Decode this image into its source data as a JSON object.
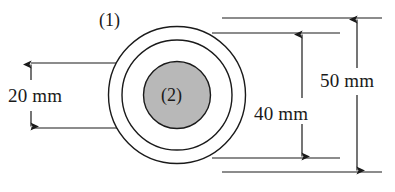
{
  "figure": {
    "type": "engineering-cross-section-diagram",
    "background_color": "#ffffff",
    "line_color": "#1a1a1a",
    "geometry": {
      "center": {
        "x": 177,
        "y": 95
      },
      "circles": [
        {
          "name": "outer-circle",
          "radius": 68.5,
          "diameter_mm": 50,
          "fill": "#ffffff",
          "stroke": "#1a1a1a"
        },
        {
          "name": "middle-circle",
          "radius": 55,
          "diameter_mm": 40,
          "fill": "#ffffff",
          "stroke": "#1a1a1a"
        },
        {
          "name": "inner-circle",
          "radius": 33.5,
          "diameter_mm": 20,
          "fill": "#b8b8b8",
          "stroke": "#1a1a1a"
        }
      ]
    },
    "part_labels": [
      {
        "id": "part-1",
        "text": "(1)",
        "refers_to": "outer-annulus"
      },
      {
        "id": "part-2",
        "text": "(2)",
        "refers_to": "inner-core"
      }
    ],
    "dimensions": [
      {
        "id": "dim-20mm",
        "label": "20 mm",
        "value": 20,
        "unit": "mm",
        "side": "left",
        "measures": "inner-circle-diameter",
        "arrow_x": 31,
        "top_y": 63,
        "bottom_y": 128,
        "extension_line_x_start": 31,
        "extension_line_x_end": 146
      },
      {
        "id": "dim-40mm",
        "label": "40 mm",
        "value": 40,
        "unit": "mm",
        "side": "right",
        "measures": "middle-circle-diameter",
        "arrow_x": 302,
        "top_y": 33,
        "bottom_y": 158,
        "extension_line_x_start": 212,
        "extension_line_x_end": 340
      },
      {
        "id": "dim-50mm",
        "label": "50 mm",
        "value": 50,
        "unit": "mm",
        "side": "right",
        "measures": "outer-circle-diameter",
        "arrow_x": 357,
        "top_y": 18,
        "bottom_y": 172,
        "extension_line_x_start": 222,
        "extension_line_x_end": 382
      }
    ]
  }
}
